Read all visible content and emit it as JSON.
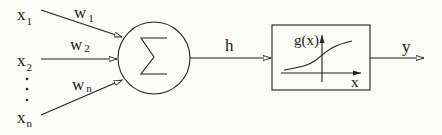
{
  "diagram": {
    "inputs": [
      {
        "name": "x",
        "sub": "1",
        "weight": "w",
        "wsub": "1"
      },
      {
        "name": "x",
        "sub": "2",
        "weight": "w",
        "wsub": "2"
      },
      {
        "name": "x",
        "sub": "n",
        "weight": "w",
        "wsub": "n"
      }
    ],
    "ellipsis": "·",
    "summation": {
      "symbol": "∑"
    },
    "intermediate": {
      "label": "h"
    },
    "activation": {
      "label": "g(x)",
      "axis_label": "x"
    },
    "output": {
      "label": "y"
    }
  }
}
